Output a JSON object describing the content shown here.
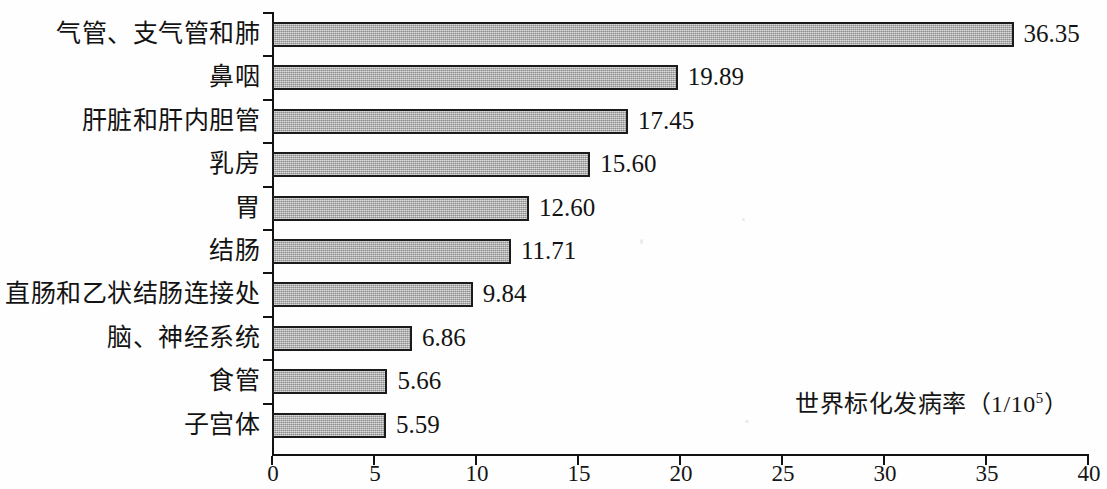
{
  "chart_data": {
    "type": "bar",
    "orientation": "horizontal",
    "title": "",
    "xlabel": "世界标化发病率（1/10⁵）",
    "ylabel": "",
    "xlim": [
      0,
      40
    ],
    "xticks": [
      "0",
      "5",
      "10",
      "15",
      "20",
      "25",
      "30",
      "35",
      "40"
    ],
    "xtick_values": [
      0,
      5,
      10,
      15,
      20,
      25,
      30,
      35,
      40
    ],
    "grid": false,
    "legend": "none",
    "categories": [
      "气管、支气管和肺",
      "鼻咽",
      "肝脏和肝内胆管",
      "乳房",
      "胃",
      "结肠",
      "直肠和乙状结肠连接处",
      "脑、神经系统",
      "食管",
      "子宫体"
    ],
    "values": [
      36.35,
      19.89,
      17.45,
      15.6,
      12.6,
      11.71,
      9.84,
      6.86,
      5.66,
      5.59
    ],
    "value_labels": [
      "36.35",
      "19.89",
      "17.45",
      "15.60",
      "12.60",
      "11.71",
      "9.84",
      "6.86",
      "5.66",
      "5.59"
    ],
    "bar_color": "#a9a9a9",
    "bar_edge_color": "#1b1b1b",
    "axis_color": "#121212",
    "background_color": "#ffffff"
  },
  "annotation": {
    "axis_note_prefix": "世界标化发病率（1/10",
    "axis_note_exponent": "5",
    "axis_note_suffix": "）"
  }
}
